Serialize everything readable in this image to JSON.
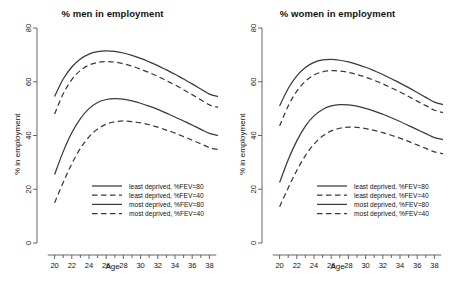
{
  "figure": {
    "width": 451,
    "height": 282,
    "background": "#ffffff",
    "line_color": "#3a3a3a",
    "axis_color": "#555555"
  },
  "panels": [
    {
      "id": "men",
      "title": "% men in employment",
      "xlabel": "Age",
      "ylabel": "% in employment"
    },
    {
      "id": "women",
      "title": "% women in employment",
      "xlabel": "Age",
      "ylabel": "% in employment"
    }
  ],
  "axes": {
    "x_ticks": [
      "20",
      "22",
      "24",
      "26",
      "28",
      "30",
      "32",
      "34",
      "36",
      "38"
    ],
    "y_ticks": [
      "0",
      "20",
      "40",
      "60",
      "80"
    ],
    "xlim": [
      19,
      39
    ],
    "ylim": [
      0,
      80
    ]
  },
  "legend": {
    "entries": [
      {
        "label": "least deprived, %FEV=80",
        "style": "solid"
      },
      {
        "label": "least deprived, %FEV=40",
        "style": "dashed"
      },
      {
        "label": "most deprived, %FEV=80",
        "style": "solid"
      },
      {
        "label": "most deprived, %FEV=40",
        "style": "dashed"
      }
    ]
  },
  "chart_data": {
    "type": "line",
    "xlabel": "Age",
    "ylabel": "% in employment",
    "xlim": [
      19,
      39
    ],
    "ylim": [
      0,
      80
    ],
    "grid": false,
    "legend_position": "bottom-center-inside",
    "x": [
      20,
      21,
      22,
      23,
      24,
      25,
      26,
      27,
      28,
      29,
      30,
      31,
      32,
      33,
      34,
      35,
      36,
      37,
      38,
      39
    ],
    "panels": [
      {
        "name": "% men in employment",
        "series": [
          {
            "name": "least deprived, %FEV=80",
            "style": "solid",
            "values": [
              54.5,
              61.0,
              65.5,
              68.5,
              70.3,
              71.2,
              71.5,
              71.3,
              70.7,
              69.8,
              68.7,
              67.4,
              66.0,
              64.4,
              62.8,
              61.0,
              59.2,
              57.3,
              55.4,
              54.5
            ]
          },
          {
            "name": "least deprived, %FEV=40",
            "style": "dashed",
            "values": [
              48.0,
              55.5,
              60.8,
              64.2,
              66.2,
              67.2,
              67.5,
              67.3,
              66.7,
              65.8,
              64.7,
              63.4,
              62.0,
              60.4,
              58.8,
              57.0,
              55.2,
              53.3,
              51.4,
              50.5
            ]
          },
          {
            "name": "most deprived, %FEV=80",
            "style": "solid",
            "values": [
              25.5,
              34.0,
              41.0,
              46.3,
              50.0,
              52.3,
              53.4,
              53.7,
              53.5,
              52.9,
              52.0,
              50.9,
              49.7,
              48.3,
              46.9,
              45.4,
              43.9,
              42.3,
              40.8,
              40.0
            ]
          },
          {
            "name": "most deprived, %FEV=40",
            "style": "dashed",
            "values": [
              15.0,
              22.5,
              29.5,
              35.2,
              39.5,
              42.4,
              44.2,
              45.1,
              45.4,
              45.2,
              44.7,
              44.0,
              43.1,
              42.0,
              40.9,
              39.6,
              38.3,
              36.9,
              35.5,
              34.8
            ]
          }
        ]
      },
      {
        "name": "% women in employment",
        "series": [
          {
            "name": "least deprived, %FEV=80",
            "style": "solid",
            "values": [
              51.0,
              57.5,
              62.2,
              65.3,
              67.2,
              68.1,
              68.3,
              68.0,
              67.4,
              66.5,
              65.4,
              64.1,
              62.7,
              61.1,
              59.5,
              57.8,
              56.0,
              54.2,
              52.4,
              51.5
            ]
          },
          {
            "name": "least deprived, %FEV=40",
            "style": "dashed",
            "values": [
              43.5,
              51.0,
              56.5,
              60.2,
              62.5,
              63.7,
              64.1,
              64.0,
              63.5,
              62.7,
              61.7,
              60.5,
              59.2,
              57.7,
              56.2,
              54.5,
              52.8,
              51.1,
              49.4,
              48.5
            ]
          },
          {
            "name": "most deprived, %FEV=80",
            "style": "solid",
            "values": [
              22.5,
              31.0,
              38.0,
              43.5,
              47.3,
              49.7,
              51.0,
              51.5,
              51.4,
              50.9,
              50.1,
              49.1,
              47.9,
              46.6,
              45.2,
              43.7,
              42.2,
              40.7,
              39.2,
              38.5
            ]
          },
          {
            "name": "most deprived, %FEV=40",
            "style": "dashed",
            "values": [
              13.5,
              20.5,
              27.0,
              32.5,
              36.8,
              39.8,
              41.7,
              42.7,
              43.1,
              43.0,
              42.6,
              41.9,
              41.1,
              40.1,
              39.0,
              37.8,
              36.5,
              35.2,
              33.9,
              33.2
            ]
          }
        ]
      }
    ]
  }
}
